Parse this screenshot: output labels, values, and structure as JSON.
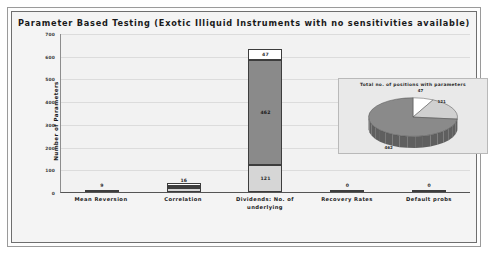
{
  "chart_data": {
    "type": "bar",
    "title": "Parameter Based Testing (Exotic Illiquid Instruments with no sensitivities available)",
    "xlabel": "",
    "ylabel": "Number of Parameters",
    "ylim": [
      0,
      700
    ],
    "yticks": [
      "0",
      "100",
      "200",
      "300",
      "400",
      "500",
      "600",
      "700"
    ],
    "grid": true,
    "stacked": true,
    "categories": [
      "Mean Reversion",
      "Correlation",
      "Dividends: No. of underlying",
      "Recovery Rates",
      "Default probs"
    ],
    "series": [
      {
        "name": "segment-lower",
        "values": [
          9,
          16,
          121,
          0,
          0
        ]
      },
      {
        "name": "segment-middle",
        "values": [
          0,
          9,
          462,
          0,
          0
        ]
      },
      {
        "name": "segment-upper",
        "values": [
          0,
          5,
          47,
          0,
          0
        ]
      }
    ],
    "bar_labels": [
      {
        "category": "Mean Reversion",
        "labels": [
          "9"
        ]
      },
      {
        "category": "Correlation",
        "labels": [
          "16"
        ]
      },
      {
        "category": "Dividends: No. of underlying",
        "labels": [
          "121",
          "462",
          "47"
        ]
      },
      {
        "category": "Recovery Rates",
        "labels": [
          "0"
        ]
      },
      {
        "category": "Default probs",
        "labels": [
          "0"
        ]
      }
    ],
    "totals": [
      9,
      30,
      630,
      0,
      0
    ],
    "colors": {
      "segment_lower": "#d6d6d6",
      "segment_middle": "#8a8a8a",
      "segment_upper": "#ffffff",
      "outline": "#3d3d3d",
      "plot_background": "#f2f2f2",
      "gridline": "#dcdcdc"
    }
  },
  "inset_chart": {
    "type": "pie",
    "title": "Total no. of positions with parameters",
    "labels": [
      "47",
      "121",
      "462"
    ],
    "values": [
      47,
      121,
      462
    ],
    "colors": [
      "#ffffff",
      "#d0d0d0",
      "#8a8a8a"
    ],
    "legend_position": "none",
    "three_d": true,
    "panel_background": "#e9e9e9"
  },
  "frame": {
    "outer_border_color": "#9a9a9a",
    "inner_border_color": "#6e6e6e",
    "background": "#f4f4f4"
  }
}
